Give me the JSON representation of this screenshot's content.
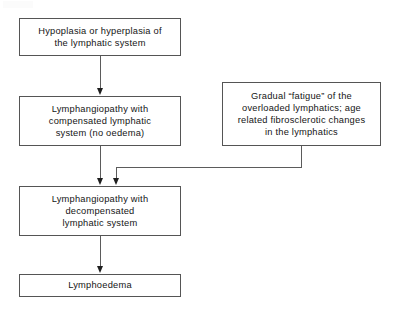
{
  "diagram": {
    "type": "flowchart",
    "title": "",
    "background_color": "#ffffff",
    "box_border_color": "#555555",
    "connector_color": "#5b5b5b",
    "arrowhead_color": "#1f1f1f",
    "nodes": [
      {
        "id": "hypoplasia",
        "label": "Hypoplasia or hyperplasia of\nthe lymphatic system"
      },
      {
        "id": "compensated",
        "label": "Lymphangiopathy  with\ncompensated  lymphatic\nsystem (no oedema)"
      },
      {
        "id": "fatigue",
        "label": "Gradual “fatigue” of the\noverloaded lymphatics; age\nrelated  fibrosclerotic  changes\nin the lymphatics"
      },
      {
        "id": "decompensated",
        "label": "Lymphangiopathy  with\ndecompensated\nlymphatic  system"
      },
      {
        "id": "lymphoedema",
        "label": "Lymphoedema"
      }
    ],
    "edges": [
      {
        "id": "edge1",
        "from": "hypoplasia",
        "to": "compensated",
        "style": "straight-down-arrow"
      },
      {
        "id": "edge2",
        "from": "compensated",
        "to": "decompensated",
        "style": "straight-down-arrow"
      },
      {
        "id": "edge3",
        "from": "fatigue",
        "to": "decompensated",
        "style": "elbow-down-left-down-arrow"
      },
      {
        "id": "edge4",
        "from": "decompensated",
        "to": "lymphoedema",
        "style": "straight-down-arrow"
      }
    ]
  }
}
